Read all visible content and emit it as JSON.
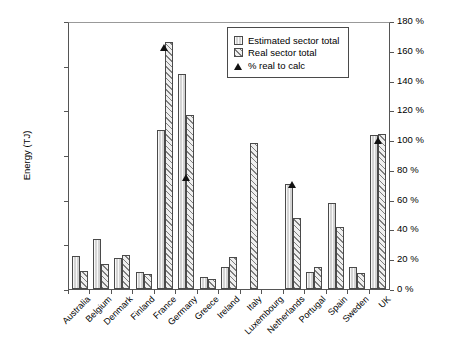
{
  "chart_data": {
    "type": "bar",
    "title": "",
    "xlabel": "",
    "ylabel": "Energy (TJ)",
    "y2label": "",
    "ylim": [
      0,
      300000
    ],
    "y2lim": [
      0,
      180
    ],
    "grid": false,
    "legend_position": "top-right",
    "categories": [
      "Australia",
      "Belgium",
      "Denmark",
      "Finland",
      "France",
      "Germany",
      "Greece",
      "Ireland",
      "Italy",
      "Luxembourg",
      "Netherlands",
      "Portugal",
      "Spain",
      "Sweden",
      "UK"
    ],
    "y_ticks": [
      "0",
      "50 000",
      "100 000",
      "150 000",
      "200 000",
      "250 000",
      "300 000"
    ],
    "y_tick_values": [
      0,
      50000,
      100000,
      150000,
      200000,
      250000,
      300000
    ],
    "y2_ticks": [
      "0 %",
      "20 %",
      "40 %",
      "60 %",
      "80 %",
      "100 %",
      "120 %",
      "140 %",
      "160 %",
      "180 %"
    ],
    "y2_tick_values": [
      0,
      20,
      40,
      60,
      80,
      100,
      120,
      140,
      160,
      180
    ],
    "series": [
      {
        "name": "Estimated sector total",
        "type": "bar",
        "axis": "left",
        "values": [
          37000,
          56000,
          35000,
          19000,
          178000,
          241000,
          13000,
          25000,
          null,
          null,
          117000,
          19000,
          96000,
          25000,
          172000
        ]
      },
      {
        "name": "Real sector total",
        "type": "bar",
        "axis": "left",
        "values": [
          20000,
          28000,
          38000,
          17000,
          277000,
          195000,
          11000,
          36000,
          163000,
          null,
          80000,
          25000,
          69000,
          18000,
          174000
        ]
      },
      {
        "name": "% real to calc",
        "type": "scatter",
        "axis": "right",
        "marker": "triangle",
        "values": [
          null,
          null,
          null,
          null,
          162,
          75,
          null,
          null,
          null,
          null,
          70,
          null,
          null,
          null,
          100
        ]
      }
    ]
  },
  "legend": {
    "items": [
      {
        "label": "Estimated sector total",
        "swatch": "est"
      },
      {
        "label": "Real sector total",
        "swatch": "real"
      },
      {
        "label": "% real to calc",
        "swatch": "tri"
      }
    ]
  },
  "colors": {
    "estimated_bar": "#d4d4d4",
    "real_bar": "#efefef",
    "hatch": "#7e7e7e",
    "marker": "#111111",
    "axis": "#555555"
  }
}
